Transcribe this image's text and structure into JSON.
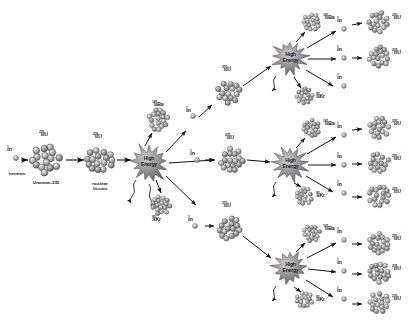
{
  "figure": {
    "background": "#ffffff",
    "ink": "#1a1a1a",
    "nucleus_fill": "#9a9a9a",
    "burst_fill": "#8d8d8d"
  },
  "labels": {
    "neutron_sup": "1",
    "neutron_sub": "0",
    "neutron_sym": "n",
    "neutron_caption": "neutron",
    "u235_sup": "235",
    "u235_sub": "92",
    "u235_sym": "U",
    "u235_caption": "Uranium-235",
    "u236_sup": "236",
    "u236_sub": "92",
    "u236_sym": "U",
    "fission_caption_line1": "nuclear",
    "fission_caption_line2": "fission",
    "ba_sup": "141",
    "ba_sub": "56",
    "ba_sym": "Ba",
    "kr_sup": "92",
    "kr_sub": "36",
    "kr_sym": "Kr",
    "burst_line1": "High",
    "burst_line2": "Energy"
  },
  "stages": {
    "gen0": {
      "name": "first fission event",
      "incoming_neutron": "1 0 n",
      "target": "235 92 U",
      "compound": "236 92 U",
      "burst": "High Energy",
      "products": [
        "141 56 Ba",
        "92 36 Kr"
      ],
      "neutrons_released": 3
    },
    "gen1": {
      "name": "second generation",
      "targets": 3,
      "target_nuclide": "235 92 U",
      "bursts": 3
    },
    "gen2": {
      "name": "third generation",
      "nuclei_top": 2,
      "nuclei_middle": 3,
      "nuclei_bottom": 3,
      "nuclide": "235 92 U"
    }
  },
  "nuclei": [
    {
      "id": "u235-start",
      "kind": "uranium",
      "cx": 46,
      "cy": 160,
      "r": 16.5,
      "label": "235 92 U"
    },
    {
      "id": "u236-compound",
      "kind": "uranium",
      "cx": 100,
      "cy": 160,
      "r": 15,
      "label": "236 92 U"
    },
    {
      "id": "ba-g1",
      "kind": "barium",
      "cx": 158,
      "cy": 120,
      "r": 12,
      "label": "141 56 Ba"
    },
    {
      "id": "kr-g1",
      "kind": "krypton",
      "cx": 161,
      "cy": 205,
      "r": 11,
      "label": "92 36 Kr"
    },
    {
      "id": "u235-g1-top",
      "kind": "uranium",
      "cx": 229,
      "cy": 92,
      "r": 13.5,
      "label": "235 92 U"
    },
    {
      "id": "u235-g1-mid",
      "kind": "uranium",
      "cx": 232,
      "cy": 160,
      "r": 13.5,
      "label": "235 92 U"
    },
    {
      "id": "u235-g1-bot",
      "kind": "uranium",
      "cx": 229,
      "cy": 228,
      "r": 13.5,
      "label": "235 92 U"
    },
    {
      "id": "ba-g2-top",
      "kind": "barium",
      "cx": 312,
      "cy": 22,
      "r": 10,
      "label": "141 56 Ba"
    },
    {
      "id": "kr-g2-top",
      "kind": "krypton",
      "cx": 305,
      "cy": 97,
      "r": 10,
      "label": "92 36 Kr"
    },
    {
      "id": "ba-g2-mid",
      "kind": "barium",
      "cx": 312,
      "cy": 128,
      "r": 10,
      "label": "141 56 Ba"
    },
    {
      "id": "kr-g2-mid",
      "kind": "krypton",
      "cx": 305,
      "cy": 196,
      "r": 10,
      "label": "92 36 Kr"
    },
    {
      "id": "ba-g2-bot",
      "kind": "barium",
      "cx": 312,
      "cy": 233,
      "r": 10,
      "label": "141 56 Ba"
    },
    {
      "id": "kr-g2-bot",
      "kind": "krypton",
      "cx": 305,
      "cy": 300,
      "r": 10,
      "label": "92 36 Kr"
    },
    {
      "id": "u235-g3-1",
      "kind": "uranium",
      "cx": 379,
      "cy": 22,
      "r": 12,
      "label": "235 92 U"
    },
    {
      "id": "u235-g3-2",
      "kind": "uranium",
      "cx": 379,
      "cy": 57,
      "r": 12,
      "label": "235 92 U"
    },
    {
      "id": "u235-g3-3",
      "kind": "uranium",
      "cx": 379,
      "cy": 128,
      "r": 12,
      "label": "235 92 U"
    },
    {
      "id": "u235-g3-4",
      "kind": "uranium",
      "cx": 379,
      "cy": 163,
      "r": 12,
      "label": "235 92 U"
    },
    {
      "id": "u235-g3-5",
      "kind": "uranium",
      "cx": 379,
      "cy": 196,
      "r": 12,
      "label": "235 92 U"
    },
    {
      "id": "u235-g3-6",
      "kind": "uranium",
      "cx": 379,
      "cy": 243,
      "r": 12,
      "label": "235 92 U"
    },
    {
      "id": "u235-g3-7",
      "kind": "uranium",
      "cx": 379,
      "cy": 273,
      "r": 12,
      "label": "235 92 U"
    },
    {
      "id": "u235-g3-8",
      "kind": "uranium",
      "cx": 379,
      "cy": 303,
      "r": 12,
      "label": "235 92 U"
    }
  ],
  "bursts": [
    {
      "id": "burst-g0",
      "cx": 149,
      "cy": 163,
      "r": 20
    },
    {
      "id": "burst-g2-top",
      "cx": 290,
      "cy": 58,
      "r": 17
    },
    {
      "id": "burst-g2-mid",
      "cx": 290,
      "cy": 164,
      "r": 17
    },
    {
      "id": "burst-g2-bot",
      "cx": 290,
      "cy": 268,
      "r": 17
    }
  ]
}
